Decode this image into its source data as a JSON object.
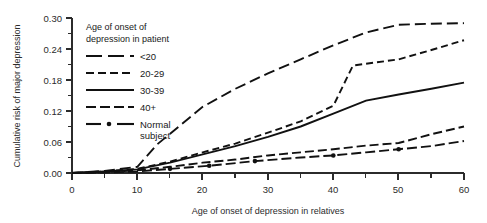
{
  "chart_data": {
    "type": "line",
    "title": "",
    "xlabel": "Age of onset of depression in relatives",
    "ylabel": "Cumulative risk of major depression",
    "xlim": [
      0,
      60
    ],
    "ylim": [
      0.0,
      0.3
    ],
    "xticks": [
      0,
      10,
      20,
      30,
      40,
      50,
      60
    ],
    "xticklabels": [
      "0",
      "10",
      "20",
      "30",
      "40",
      "50",
      "60"
    ],
    "xminorticks": [
      5,
      15,
      25,
      35,
      45,
      55
    ],
    "yticks": [
      0.0,
      0.06,
      0.12,
      0.18,
      0.24,
      0.3
    ],
    "yticklabels": [
      "0.00",
      "0.06",
      "0.12",
      "0.18",
      "0.24",
      "0.30"
    ],
    "yminorticks": [
      0.03,
      0.09,
      0.15,
      0.21,
      0.27
    ],
    "grid": false,
    "legend_position": "upper-left-inside",
    "legend_title": "Age of onset of\ndepression in patient",
    "series": [
      {
        "name": "<20",
        "style": "long-dash",
        "x": [
          0,
          5,
          10,
          13,
          20,
          25,
          30,
          35,
          40,
          45,
          50,
          55,
          60
        ],
        "y": [
          0.0,
          0.004,
          0.012,
          0.055,
          0.128,
          0.163,
          0.193,
          0.22,
          0.247,
          0.272,
          0.287,
          0.289,
          0.29
        ]
      },
      {
        "name": "20-29",
        "style": "medium-dash",
        "x": [
          0,
          5,
          10,
          15,
          20,
          25,
          30,
          35,
          40,
          43,
          50,
          55,
          60
        ],
        "y": [
          0.0,
          0.003,
          0.008,
          0.022,
          0.04,
          0.057,
          0.078,
          0.1,
          0.13,
          0.208,
          0.22,
          0.238,
          0.257
        ]
      },
      {
        "name": "30-39",
        "style": "solid",
        "x": [
          0,
          5,
          10,
          15,
          20,
          25,
          30,
          35,
          40,
          45,
          50,
          55,
          60
        ],
        "y": [
          0.0,
          0.003,
          0.007,
          0.02,
          0.036,
          0.052,
          0.07,
          0.09,
          0.115,
          0.14,
          0.152,
          0.163,
          0.175
        ]
      },
      {
        "name": "40+",
        "style": "long-medium-dash",
        "x": [
          0,
          5,
          10,
          15,
          20,
          25,
          30,
          35,
          40,
          45,
          50,
          55,
          60
        ],
        "y": [
          0.0,
          0.002,
          0.005,
          0.012,
          0.02,
          0.026,
          0.034,
          0.04,
          0.046,
          0.053,
          0.058,
          0.075,
          0.09
        ]
      },
      {
        "name": "Normal subject",
        "style": "dash-dot",
        "x": [
          0,
          5,
          10,
          15,
          21,
          28,
          35,
          40,
          45,
          50,
          55,
          60
        ],
        "y": [
          0.0,
          0.001,
          0.003,
          0.008,
          0.014,
          0.023,
          0.03,
          0.034,
          0.04,
          0.046,
          0.052,
          0.062
        ],
        "markers_x": [
          15,
          21,
          28,
          40,
          50
        ],
        "markers_y": [
          0.008,
          0.014,
          0.023,
          0.034,
          0.046
        ]
      }
    ]
  },
  "legend": {
    "title_line1": "Age of onset of",
    "title_line2": "depression in patient",
    "entries": [
      {
        "label": "<20"
      },
      {
        "label": "20-29"
      },
      {
        "label": "30-39"
      },
      {
        "label": "40+"
      },
      {
        "label_line1": "Normal",
        "label_line2": "subject"
      }
    ]
  },
  "colors": {
    "ink": "#111111",
    "axis": "#2b2b2b",
    "background": "#ffffff"
  }
}
